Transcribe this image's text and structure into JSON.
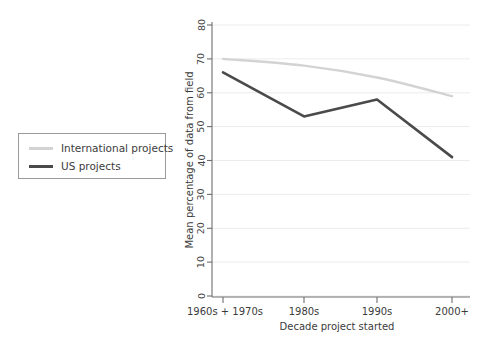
{
  "chart_data": {
    "type": "line",
    "title": "",
    "xlabel": "Decade project started",
    "ylabel": "Mean percentage of data from field",
    "categories": [
      "1960s + 1970s",
      "1980s",
      "1990s",
      "2000+"
    ],
    "series": [
      {
        "name": "International projects",
        "color": "#d3d3d3",
        "values": [
          70,
          68,
          64.5,
          59
        ]
      },
      {
        "name": "US projects",
        "color": "#4a4a4a",
        "values": [
          66,
          53,
          58,
          41
        ]
      }
    ],
    "ylim": [
      0,
      80
    ],
    "yticks": [
      0,
      10,
      20,
      30,
      40,
      50,
      60,
      70,
      80
    ],
    "ytick_labels": [
      "0",
      "10",
      "20",
      "30",
      "40",
      "50",
      "60",
      "70",
      "80"
    ],
    "grid": true,
    "grid_axis": "y",
    "legend_position": "left-outside",
    "legend_entries": [
      "International projects",
      "US projects"
    ],
    "background": "#ffffff",
    "axis_color": "#6e6e6e",
    "grid_color": "#ececec"
  },
  "legend": {
    "international_label": "International projects",
    "us_label": "US projects"
  },
  "axes": {
    "y_title": "Mean percentage of data from field",
    "x_title": "Decade project started",
    "y_tick_0": "0",
    "y_tick_10": "10",
    "y_tick_20": "20",
    "y_tick_30": "30",
    "y_tick_40": "40",
    "y_tick_50": "50",
    "y_tick_60": "60",
    "y_tick_70": "70",
    "y_tick_80": "80",
    "x_cat_0": "1960s + 1970s",
    "x_cat_1": "1980s",
    "x_cat_2": "1990s",
    "x_cat_3": "2000+"
  }
}
